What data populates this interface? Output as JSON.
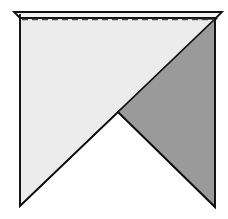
{
  "diagram": {
    "colors": {
      "background": "#ffffff",
      "light_face": "#ececec",
      "dark_flap": "#9a9a9a",
      "top_band": "#f2f2f2",
      "stroke": "#111111",
      "dashed_line": "#444444"
    },
    "shapes": {
      "top_band": {
        "points": "14,12 222,12 216,18 20,18"
      },
      "fold_line": {
        "x1": 22,
        "y1": 19,
        "x2": 214,
        "y2": 19,
        "style": "dashed"
      },
      "light_face": {
        "points": "20,14 216,19 118,112 20,206"
      },
      "dark_flap": {
        "points": "215,19 215,207 118,112"
      },
      "outline": {
        "points": "20,14 20,206 118,112 215,207 215,19"
      }
    }
  }
}
